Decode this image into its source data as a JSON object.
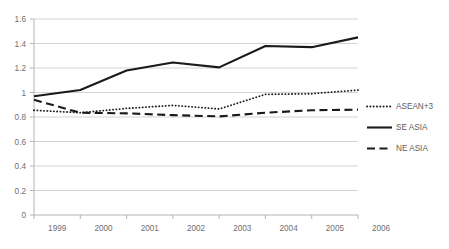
{
  "chart_data": {
    "type": "line",
    "title": "",
    "subtitle": "",
    "xlabel": "",
    "ylabel": "",
    "categories": [
      "1999",
      "2000",
      "2001",
      "2002",
      "2003",
      "2004",
      "2005",
      "2006"
    ],
    "x": [
      1999,
      2000,
      2001,
      2002,
      2003,
      2004,
      2005,
      2006
    ],
    "xlim": [
      1999,
      2006
    ],
    "ylim": [
      0,
      1.6
    ],
    "y_ticks": [
      0,
      0.2,
      0.4,
      0.6,
      0.8,
      1,
      1.2,
      1.4,
      1.6
    ],
    "y_tick_labels": [
      "0",
      "0.2",
      "0.4",
      "0.6",
      "0.8",
      "1",
      "1.2",
      "1.4",
      "1.6"
    ],
    "grid": "horizontal",
    "legend_position": "right",
    "series": [
      {
        "name": "ASEAN+3",
        "style": "dotted",
        "color": "#1a1a1a",
        "values": [
          0.855,
          0.835,
          0.87,
          0.895,
          0.865,
          0.985,
          0.99,
          1.02
        ]
      },
      {
        "name": "SE ASIA",
        "style": "solid",
        "color": "#1a1a1a",
        "values": [
          0.97,
          1.02,
          1.18,
          1.245,
          1.205,
          1.38,
          1.37,
          1.45
        ]
      },
      {
        "name": "NE ASIA",
        "style": "dashed",
        "color": "#1a1a1a",
        "values": [
          0.94,
          0.835,
          0.83,
          0.815,
          0.805,
          0.835,
          0.855,
          0.86
        ]
      }
    ]
  },
  "axes": {
    "y_tick_0": "1.6",
    "y_tick_1": "1.4",
    "y_tick_2": "1.2",
    "y_tick_3": "1",
    "y_tick_4": "0.8",
    "y_tick_5": "0.6",
    "y_tick_6": "0.4",
    "y_tick_7": "0.2",
    "y_tick_8": "0",
    "x_tick_0": "1999",
    "x_tick_1": "2000",
    "x_tick_2": "2001",
    "x_tick_3": "2002",
    "x_tick_4": "2003",
    "x_tick_5": "2004",
    "x_tick_6": "2005",
    "x_tick_7": "2006"
  },
  "legend": {
    "items": [
      {
        "label": "ASEAN+3",
        "style": "dotted"
      },
      {
        "label": "SE ASIA",
        "style": "solid"
      },
      {
        "label": "NE ASIA",
        "style": "dashed"
      }
    ]
  },
  "colors": {
    "background": "#ffffff",
    "gridline": "#d2d2d2",
    "axis": "#b4b4b4",
    "series_line": "#1a1a1a",
    "tick_text": "#6f6f6f",
    "legend_text": "#5d5d5d"
  }
}
